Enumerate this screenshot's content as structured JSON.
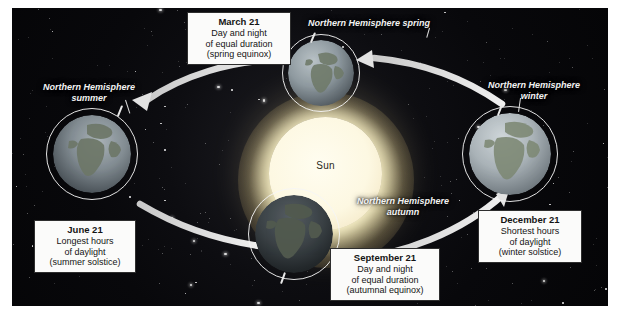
{
  "diagram": {
    "center_body": {
      "name": "Sun",
      "color": "#fdf8e2"
    },
    "background": {
      "type": "starfield",
      "color": "#08080b"
    },
    "orbit": {
      "shape": "ellipse",
      "direction": "counterclockwise",
      "color": "#e6e6e6",
      "arrow_count": 4
    }
  },
  "info_boxes": [
    {
      "id": "march",
      "date": "March 21",
      "line1": "Day and night",
      "line2": "of equal duration",
      "line3": "(spring equinox)"
    },
    {
      "id": "june",
      "date": "June 21",
      "line1": "Longest hours",
      "line2": "of daylight",
      "line3": "(summer solstice)"
    },
    {
      "id": "september",
      "date": "September 21",
      "line1": "Day and night",
      "line2": "of equal duration",
      "line3": "(autumnal equinox)"
    },
    {
      "id": "december",
      "date": "December 21",
      "line1": "Shortest hours",
      "line2": "of daylight",
      "line3": "(winter solstice)"
    }
  ],
  "season_labels": [
    {
      "id": "spring",
      "line1": "Northern Hemisphere spring",
      "line2": ""
    },
    {
      "id": "summer",
      "line1": "Northern Hemisphere",
      "line2": "summer"
    },
    {
      "id": "autumn",
      "line1": "Northern Hemisphere",
      "line2": "autumn"
    },
    {
      "id": "winter",
      "line1": "Northern Hemisphere",
      "line2": "winter"
    }
  ],
  "globes": [
    {
      "id": "globe-spring",
      "position": "top",
      "lit": "partial"
    },
    {
      "id": "globe-summer",
      "position": "left",
      "lit": "partial"
    },
    {
      "id": "globe-autumn",
      "position": "bottom",
      "lit": "dark"
    },
    {
      "id": "globe-winter",
      "position": "right",
      "lit": "bright"
    }
  ],
  "sun": {
    "label": "Sun"
  }
}
